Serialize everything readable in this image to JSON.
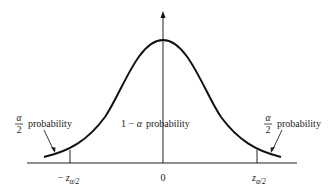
{
  "diagram": {
    "type": "standard-normal-distribution",
    "colors": {
      "curve": "#111111",
      "axis": "#222222",
      "text": "#1a1a1a",
      "background": "#ffffff"
    },
    "x_axis": {
      "center_label": "0",
      "left_critical_label": {
        "sign": "−",
        "symbol": "z",
        "subscript": "α/2"
      },
      "right_critical_label": {
        "symbol": "z",
        "subscript": "α/2"
      }
    },
    "regions": {
      "left_tail": {
        "fraction_numerator": "α",
        "fraction_denominator": "2",
        "text": "probability"
      },
      "center": {
        "prefix": "1 − ",
        "symbol": "α",
        "text": "probability"
      },
      "right_tail": {
        "fraction_numerator": "α",
        "fraction_denominator": "2",
        "text": "probability"
      }
    },
    "icons": {
      "y-axis-arrow": "arrowhead-up"
    }
  }
}
